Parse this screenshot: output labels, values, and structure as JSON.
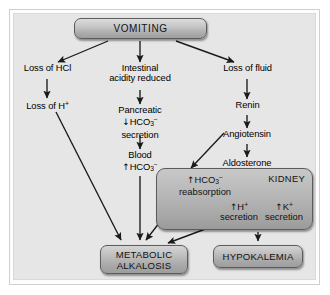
{
  "figure": {
    "background_color": "#e6e6e6",
    "frame_color": "#cfcfcf",
    "box_fill_color": "#b4b4b4",
    "box_border_color": "#5c5c5c",
    "text_color": "#000000",
    "arrow_color": "#1a1a1a"
  },
  "nodes": {
    "vomiting": "VOMITING",
    "loss_of_hcl": "Loss of HCl",
    "loss_of_h": "Loss of H",
    "loss_of_h_sup": "+",
    "intestinal_line1": "Intestinal",
    "intestinal_line2": "acidity reduced",
    "pancreatic_line1": "Pancreatic",
    "pancreatic_arrow": "↓",
    "pancreatic_hco3": "HCO",
    "pancreatic_hco3_sub": "3",
    "pancreatic_hco3_sup": "−",
    "pancreatic_line3": "secretion",
    "blood_line1": "Blood",
    "blood_arrow": "↑",
    "blood_hco3": "HCO",
    "blood_hco3_sub": "3",
    "blood_hco3_sup": "−",
    "loss_of_fluid": "Loss of fluid",
    "renin": "Renin",
    "angiotensin": "Angiotensin",
    "aldosterone": "Aldosterone"
  },
  "kidney_box": {
    "title": "KIDNEY",
    "hco3_arrow": "↑",
    "hco3_label": "HCO",
    "hco3_sub": "3",
    "hco3_sup": "−",
    "hco3_line2": "reabsorption",
    "h_arrow": "↑",
    "h_label": "H",
    "h_sup": "+",
    "h_line2": "secretion",
    "k_arrow": "↑",
    "k_label": "K",
    "k_sup": "+",
    "k_line2": "secretion"
  },
  "outcomes": {
    "metabolic_line1": "METABOLIC",
    "metabolic_line2": "ALKALOSIS",
    "hypokalemia": "HYPOKALEMIA"
  },
  "edges": [
    {
      "from": "vomiting",
      "to": "loss_of_hcl"
    },
    {
      "from": "vomiting",
      "to": "intestinal_acidity_reduced"
    },
    {
      "from": "vomiting",
      "to": "loss_of_fluid"
    },
    {
      "from": "loss_of_hcl",
      "to": "loss_of_h"
    },
    {
      "from": "loss_of_h",
      "to": "metabolic_alkalosis"
    },
    {
      "from": "intestinal_acidity_reduced",
      "to": "pancreatic_hco3_secretion"
    },
    {
      "from": "pancreatic_hco3_secretion",
      "to": "blood_hco3"
    },
    {
      "from": "blood_hco3",
      "to": "metabolic_alkalosis"
    },
    {
      "from": "loss_of_fluid",
      "to": "renin"
    },
    {
      "from": "renin",
      "to": "angiotensin"
    },
    {
      "from": "angiotensin",
      "to": "aldosterone"
    },
    {
      "from": "angiotensin",
      "to": "hco3_reabsorption"
    },
    {
      "from": "aldosterone",
      "to": "h_secretion"
    },
    {
      "from": "aldosterone",
      "to": "k_secretion"
    },
    {
      "from": "hco3_reabsorption",
      "to": "metabolic_alkalosis"
    },
    {
      "from": "h_secretion",
      "to": "metabolic_alkalosis"
    },
    {
      "from": "k_secretion",
      "to": "hypokalemia"
    }
  ]
}
